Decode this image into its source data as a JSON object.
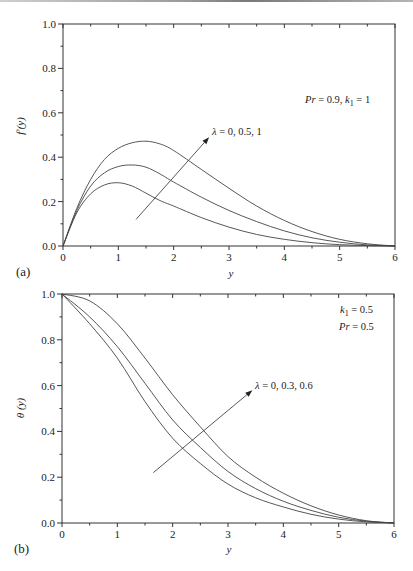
{
  "chart_data": [
    {
      "id": "a",
      "type": "line",
      "panel_label": "(a)",
      "title": "",
      "xlabel": "y",
      "ylabel": "f′(y)",
      "xlim": [
        0,
        6
      ],
      "ylim": [
        0,
        1.0
      ],
      "xticks": [
        "0",
        "1",
        "2",
        "3",
        "4",
        "5",
        "6"
      ],
      "yticks": [
        "0.0",
        "0.2",
        "0.4",
        "0.6",
        "0.8",
        "1.0"
      ],
      "grid": false,
      "x": [
        0,
        0.25,
        0.5,
        0.75,
        1,
        1.25,
        1.5,
        1.75,
        2,
        2.5,
        3,
        3.5,
        4,
        4.5,
        5,
        5.5,
        6
      ],
      "series": [
        {
          "name": "λ = 0",
          "values": [
            0,
            0.15,
            0.235,
            0.275,
            0.285,
            0.27,
            0.238,
            0.205,
            0.18,
            0.128,
            0.085,
            0.052,
            0.03,
            0.015,
            0.006,
            0.002,
            0
          ]
        },
        {
          "name": "λ = 0.5",
          "values": [
            0,
            0.16,
            0.27,
            0.33,
            0.358,
            0.365,
            0.355,
            0.325,
            0.288,
            0.22,
            0.16,
            0.11,
            0.068,
            0.037,
            0.017,
            0.005,
            0
          ]
        },
        {
          "name": "λ = 1",
          "values": [
            0,
            0.17,
            0.3,
            0.39,
            0.44,
            0.465,
            0.472,
            0.46,
            0.43,
            0.345,
            0.26,
            0.18,
            0.115,
            0.065,
            0.03,
            0.01,
            0
          ]
        }
      ],
      "annotations": {
        "lambda": {
          "sym": "λ",
          "text": " = 0, 0.5, 1"
        },
        "params": {
          "p1": "Pr",
          "t1": " = 0.9, ",
          "p2": "k",
          "sub": "1",
          "t2": " = 1"
        }
      },
      "arrow": {
        "from": [
          1.32,
          0.12
        ],
        "to": [
          2.64,
          0.49
        ]
      }
    },
    {
      "id": "b",
      "type": "line",
      "panel_label": "(b)",
      "title": "",
      "xlabel": "y",
      "ylabel": "θ (y)",
      "xlim": [
        0,
        6
      ],
      "ylim": [
        0,
        1.0
      ],
      "xticks": [
        "0",
        "1",
        "2",
        "3",
        "4",
        "5",
        "6"
      ],
      "yticks": [
        "0.0",
        "0.2",
        "0.4",
        "0.6",
        "0.8",
        "1.0"
      ],
      "grid": false,
      "x": [
        0,
        0.5,
        1,
        1.5,
        2,
        2.5,
        3,
        3.5,
        4,
        4.5,
        5,
        5.5,
        6
      ],
      "series": [
        {
          "name": "λ = 0",
          "values": [
            1,
            0.87,
            0.72,
            0.53,
            0.37,
            0.26,
            0.17,
            0.11,
            0.07,
            0.038,
            0.017,
            0.005,
            0
          ]
        },
        {
          "name": "λ = 0.3",
          "values": [
            1,
            0.9,
            0.77,
            0.61,
            0.45,
            0.33,
            0.225,
            0.15,
            0.095,
            0.055,
            0.025,
            0.008,
            0
          ]
        },
        {
          "name": "λ = 0.6",
          "values": [
            1,
            0.97,
            0.87,
            0.72,
            0.56,
            0.42,
            0.29,
            0.2,
            0.13,
            0.075,
            0.035,
            0.01,
            0
          ]
        }
      ],
      "annotations": {
        "lambda": {
          "sym": "λ",
          "text": " = 0, 0.3, 0.6"
        },
        "params": {
          "p2": "k",
          "sub": "1",
          "t2": " = 0.5",
          "p1": "Pr",
          "t1": " = 0.5"
        }
      },
      "arrow": {
        "from": [
          1.65,
          0.22
        ],
        "to": [
          3.44,
          0.58
        ]
      }
    }
  ]
}
